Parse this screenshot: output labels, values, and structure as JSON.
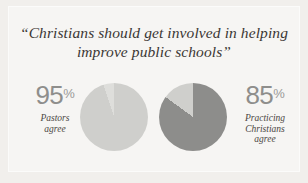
{
  "figure": {
    "background_color": "#f1efec",
    "panel_color": "#f6f5f3",
    "title_lines": [
      "“Christians should get involved in helping",
      "improve public schools”"
    ]
  },
  "chart_data": {
    "type": "pie",
    "title": "“Christians should get involved in helping improve public schools”",
    "xlabel": "",
    "ylabel": "",
    "legend_position": "none",
    "grid": false,
    "charts": [
      {
        "name": "pastors",
        "label_lines": [
          "Pastors",
          "agree"
        ],
        "value": 95,
        "value_display": "95",
        "unit": "%",
        "slices": [
          {
            "name": "agree",
            "value": 95,
            "color": "#cfcfcc"
          },
          {
            "name": "remainder",
            "value": 5,
            "color": "#dededb"
          }
        ],
        "start_angle_deg": 0,
        "direction": "clockwise"
      },
      {
        "name": "practicing-christians",
        "label_lines": [
          "Practicing",
          "Christians",
          "agree"
        ],
        "value": 85,
        "value_display": "85",
        "unit": "%",
        "slices": [
          {
            "name": "agree",
            "value": 85,
            "color": "#8d8d8b"
          },
          {
            "name": "remainder",
            "value": 15,
            "color": "#cfcfcc"
          }
        ],
        "start_angle_deg": 0,
        "direction": "clockwise"
      }
    ]
  },
  "colors": {
    "title_text": "#3b3734",
    "stat_number": "#8e8e8c",
    "stat_percent": "#9a9a98",
    "stat_label": "#4a4642",
    "pie_light": "#cfcfcc",
    "pie_lighter": "#dededb",
    "pie_dark": "#8d8d8b"
  }
}
